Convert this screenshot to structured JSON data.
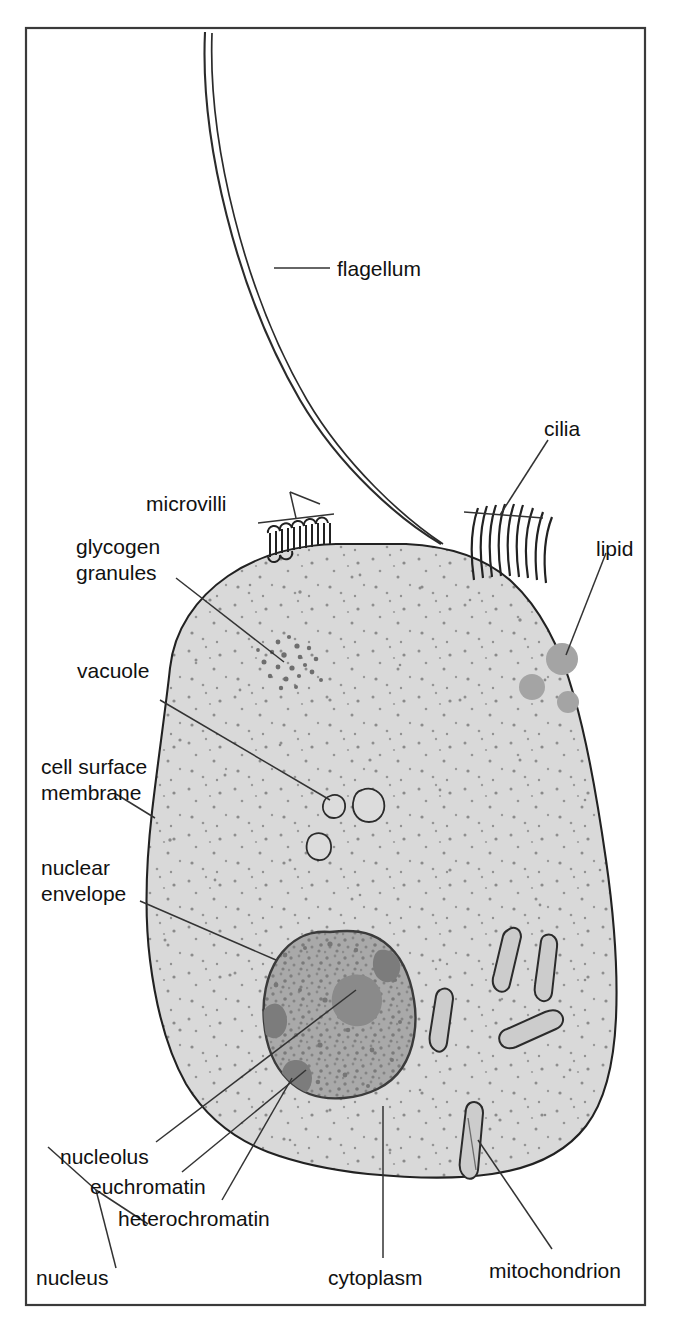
{
  "figure": {
    "frame": {
      "border_color": "#3a3a3a"
    },
    "colors": {
      "background": "#ffffff",
      "cytoplasm": "#d9d9d9",
      "cytoplasm_speckle": "#8c8c8c",
      "nucleus": "#a8a8a8",
      "nucleolus": "#8a8a8a",
      "lipid": "#a6a6a6",
      "mitochondrion": "#cfcfcf",
      "outline": "#222222",
      "leader_line": "#333333"
    }
  },
  "labels": {
    "flagellum": "flagellum",
    "cilia": "cilia",
    "microvilli": "microvilli",
    "lipid": "lipid",
    "glycogen_granules_line1": "glycogen",
    "glycogen_granules_line2": "granules",
    "vacuole": "vacuole",
    "cell_surface_membrane_line1": "cell surface",
    "cell_surface_membrane_line2": "membrane",
    "nuclear_envelope_line1": "nuclear",
    "nuclear_envelope_line2": "envelope",
    "nucleolus": "nucleolus",
    "euchromatin": "euchromatin",
    "heterochromatin": "heterochromatin",
    "nucleus": "nucleus",
    "cytoplasm": "cytoplasm",
    "mitochondrion": "mitochondrion"
  },
  "structures": {
    "lipid_droplets": 3,
    "vacuoles": 3,
    "mitochondria": 5,
    "cilia_count": 9,
    "microvilli_count": 18,
    "flagella": 1
  },
  "caption": ""
}
